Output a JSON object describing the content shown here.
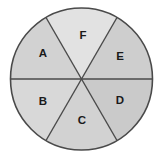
{
  "figure": {
    "name": "circle-divided-into-six-sectors",
    "background_color": "#ffffff",
    "outline_color": "#4a4a4a",
    "divider_color": "#4a4a4a",
    "outline_width": 1.6,
    "divider_width": 1.4,
    "circle": {
      "center_x": 81.5,
      "center_y": 79,
      "radius": 71
    }
  },
  "chart_data": {
    "type": "pie",
    "title": "",
    "categories": [
      "A",
      "B",
      "C",
      "D",
      "E",
      "F"
    ],
    "values": [
      60,
      60,
      60,
      60,
      60,
      60
    ],
    "units": "degrees",
    "legend": "none",
    "grid": false,
    "slices": [
      {
        "label": "A",
        "start_angle_deg": 120,
        "end_angle_deg": 180,
        "sweep_deg": 60,
        "fill": "#d2d2d2",
        "label_x": 43,
        "label_y": 54
      },
      {
        "label": "B",
        "start_angle_deg": 180,
        "end_angle_deg": 240,
        "sweep_deg": 60,
        "fill": "#d8d8d8",
        "label_x": 43,
        "label_y": 102
      },
      {
        "label": "C",
        "start_angle_deg": 240,
        "end_angle_deg": 300,
        "sweep_deg": 60,
        "fill": "#d2d2d2",
        "label_x": 82,
        "label_y": 121
      },
      {
        "label": "D",
        "start_angle_deg": 300,
        "end_angle_deg": 360,
        "sweep_deg": 60,
        "fill": "#cacaca",
        "label_x": 120,
        "label_y": 101
      },
      {
        "label": "E",
        "start_angle_deg": 0,
        "end_angle_deg": 60,
        "sweep_deg": 60,
        "fill": "#cecece",
        "label_x": 120,
        "label_y": 57
      },
      {
        "label": "F",
        "start_angle_deg": 60,
        "end_angle_deg": 120,
        "sweep_deg": 60,
        "fill": "#e2e2e2",
        "label_x": 83,
        "label_y": 36
      }
    ]
  }
}
